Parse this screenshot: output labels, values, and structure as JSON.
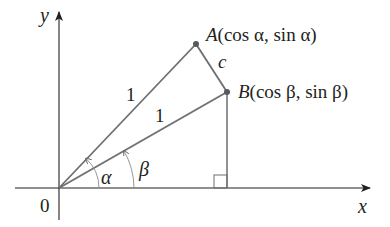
{
  "diagram": {
    "type": "unit-circle-angle-difference",
    "axes": {
      "x_label": "x",
      "y_label": "y",
      "origin_label": "0"
    },
    "points": {
      "A": {
        "name": "A",
        "coords": "(cos α, sin α)"
      },
      "B": {
        "name": "B",
        "coords": "(cos β, sin β)"
      }
    },
    "segments": {
      "OA_label": "1",
      "OB_label": "1",
      "AB_label": "c"
    },
    "angles": {
      "alpha": "α",
      "beta": "β"
    },
    "colors": {
      "line": "#6d6e71",
      "axis": "#231f20",
      "text": "#231f20"
    }
  }
}
